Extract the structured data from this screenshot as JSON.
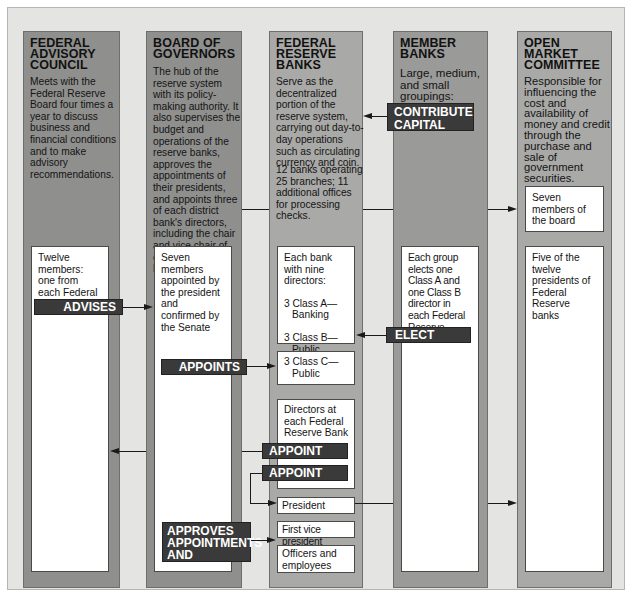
{
  "columns": [
    {
      "id": "federal-advisory-council",
      "title_lines": [
        "FEDERAL",
        "ADVISORY",
        "COUNCIL"
      ],
      "description": "Meets with the Federal Reserve Board four times a year to discuss business and financial conditions and to make advisory recommendations.",
      "boxes": [
        {
          "text": "Twelve members: one from each Federal Reserve Bank"
        }
      ]
    },
    {
      "id": "board-of-governors",
      "title_lines": [
        "BOARD OF",
        "GOVERNORS"
      ],
      "description": "The hub of the reserve system with its policy-making authority. It also supervises the budget and operations of the reserve banks, approves the appointments of their presidents, and appoints three of each district bank's directors, including the chair and vice chair of each reserve bank's board.",
      "boxes": [
        {
          "text": "Seven members appointed by the president and confirmed by the Senate"
        }
      ]
    },
    {
      "id": "federal-reserve-banks",
      "title_lines": [
        "FEDERAL",
        "RESERVE",
        "BANKS"
      ],
      "description": "Serve as the decentralized portion of the reserve system, carrying out day-to-day operations such as circulating currency and coin.",
      "stats": "12 banks operating 25 branches; 11 additional offices for processing checks.",
      "boxes": [
        {
          "intro": "Each bank with nine directors:",
          "class_a": "3 Class A—",
          "class_a_sub": "Banking",
          "class_b": "3 Class B—",
          "class_b_sub": "Public"
        },
        {
          "line1": "3 Class C—",
          "line2": "Public"
        },
        {
          "text": "Directors at each Federal Reserve Bank"
        },
        {
          "text": "President"
        },
        {
          "text": "First vice president"
        },
        {
          "text": "Officers and employees"
        }
      ]
    },
    {
      "id": "member-banks",
      "title_lines": [
        "MEMBER",
        "BANKS"
      ],
      "description": "Large, medium, and small groupings:",
      "boxes": [
        {
          "text": "Each group elects one Class A and one Class B director in each Federal Reserve district"
        }
      ]
    },
    {
      "id": "open-market-committee",
      "title_lines": [
        "OPEN",
        "MARKET",
        "COMMITTEE"
      ],
      "description": "Responsible for influencing the cost and availability of money and credit through the purchase and sale of government securities.",
      "boxes": [
        {
          "text": "Seven members of the board"
        },
        {
          "text": "Five of the twelve presidents of Federal Reserve banks"
        }
      ]
    }
  ],
  "relations": {
    "contribute_capital": [
      "CONTRIBUTE",
      "CAPITAL"
    ],
    "advises": "ADVISES",
    "elect": "ELECT",
    "appoints": "APPOINTS",
    "appoint_1": "APPOINT",
    "appoint_2": "APPOINT",
    "approves": [
      "APPROVES",
      "APPOINTMENTS",
      "AND SALARIES"
    ]
  },
  "colors": {
    "background": "#e4e4e2",
    "column_dark": "#8f8f8d",
    "column_light": "#a9a9a7",
    "tag": "#3a3a3a"
  }
}
